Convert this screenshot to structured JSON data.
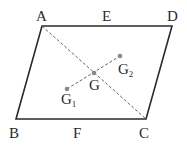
{
  "diagram": {
    "type": "parallelogram-with-centroids",
    "colors": {
      "edge": "#2a2a2a",
      "dashed": "#555555",
      "point": "#888888"
    },
    "vertices": {
      "A": {
        "label": "A",
        "x": 42,
        "y": 26
      },
      "D": {
        "label": "D",
        "x": 172,
        "y": 26
      },
      "B": {
        "label": "B",
        "x": 16,
        "y": 119
      },
      "C": {
        "label": "C",
        "x": 146,
        "y": 119
      }
    },
    "midpoints": {
      "E": {
        "label": "E"
      },
      "F": {
        "label": "F"
      }
    },
    "points": {
      "G": {
        "label": "G",
        "x": 94,
        "y": 73
      },
      "G1": {
        "label": "G",
        "sub": "1",
        "x": 67,
        "y": 89
      },
      "G2": {
        "label": "G",
        "sub": "2",
        "x": 120,
        "y": 56
      }
    }
  }
}
